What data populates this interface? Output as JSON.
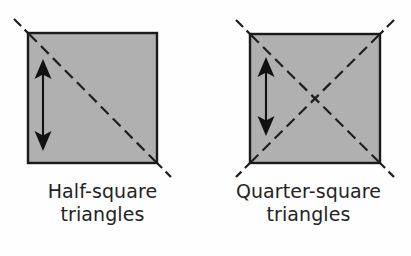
{
  "figure": {
    "background_color": "#fefefe"
  },
  "style": {
    "square_fill": "#b0b0b0",
    "square_stroke": "#1a1a1a",
    "dash_color": "#1f1f1f",
    "arrow_color": "#111111",
    "caption_color": "#232323"
  },
  "panels": [
    {
      "id": "half-square",
      "caption_line1": "Half-square",
      "caption_line2": "triangles",
      "square": {
        "x": 28,
        "y": 33,
        "width": 129,
        "height": 130,
        "fill": "#b0b0b0",
        "stroke": "#1a1a1a",
        "stroke_width": 2.4
      },
      "diagonals": [
        {
          "name": "diagonal-tl-br",
          "x1": 14,
          "y1": 19,
          "x2": 171,
          "y2": 177
        }
      ],
      "arrow": {
        "name": "height-arrow",
        "x": 43,
        "y_top": 60,
        "y_bottom": 150,
        "double_headed": true
      }
    },
    {
      "id": "quarter-square",
      "caption_line1": "Quarter-square",
      "caption_line2": "triangles",
      "square": {
        "x": 44,
        "y": 34,
        "width": 130,
        "height": 129,
        "fill": "#b0b0b0",
        "stroke": "#1a1a1a",
        "stroke_width": 2.4
      },
      "diagonals": [
        {
          "name": "diagonal-tl-br",
          "x1": 30,
          "y1": 20,
          "x2": 188,
          "y2": 177
        },
        {
          "name": "diagonal-tr-bl",
          "x1": 188,
          "y1": 20,
          "x2": 30,
          "y2": 177
        }
      ],
      "arrow": {
        "name": "height-arrow",
        "x": 60,
        "y_top": 58,
        "y_bottom": 135,
        "double_headed": true
      }
    }
  ]
}
